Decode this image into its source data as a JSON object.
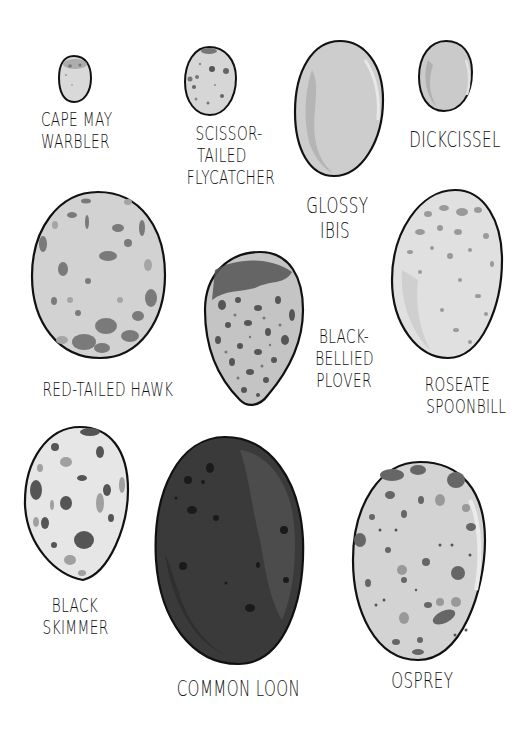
{
  "eggs": [
    {
      "id": "cape-may-warbler",
      "lines": [
        "CAPE MAY",
        "WARBLER"
      ]
    },
    {
      "id": "scissor-tailed-flycatcher",
      "lines": [
        "SCISSOR-",
        "TAILED",
        "FLYCATCHER"
      ]
    },
    {
      "id": "glossy-ibis",
      "lines": [
        "GLOSSY",
        "IBIS"
      ]
    },
    {
      "id": "dickcissel",
      "lines": [
        "DICKCISSEL"
      ]
    },
    {
      "id": "red-tailed-hawk",
      "lines": [
        "RED-TAILED HAWK"
      ]
    },
    {
      "id": "black-bellied-plover",
      "lines": [
        "BLACK-",
        "BELLIED",
        "PLOVER"
      ]
    },
    {
      "id": "roseate-spoonbill",
      "lines": [
        "ROSEATE",
        "SPOONBILL"
      ]
    },
    {
      "id": "black-skimmer",
      "lines": [
        "BLACK",
        "SKIMMER"
      ]
    },
    {
      "id": "common-loon",
      "lines": [
        "COMMON LOON"
      ]
    },
    {
      "id": "osprey",
      "lines": [
        "OSPREY"
      ]
    }
  ],
  "colors": {
    "outline": "#111111",
    "shell_light": "#d6d6d6",
    "shell_pale": "#e6e6e6",
    "spot_mid": "#8a8a8a",
    "spot_dark": "#555555",
    "loon_shell": "#3a3a3a"
  }
}
